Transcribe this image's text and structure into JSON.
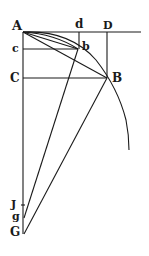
{
  "diagram": {
    "labels": {
      "A": "A",
      "d": "d",
      "D": "D",
      "c": "c",
      "b": "b",
      "C": "C",
      "B": "B",
      "J": "J",
      "g": "g",
      "G": "G"
    },
    "stroke_color": "#1a1a1a",
    "background": "#ffffff"
  }
}
